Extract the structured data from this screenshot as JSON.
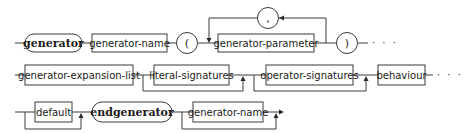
{
  "diagram": {
    "type": "syntax-diagram",
    "rows": [
      {
        "id": "row1",
        "elements": [
          {
            "kind": "terminal",
            "label": "generator"
          },
          {
            "kind": "nonterminal",
            "label": "generator-name"
          },
          {
            "kind": "symbol",
            "label": "("
          },
          {
            "kind": "nonterminal",
            "label": "generator-parameter",
            "repeat_separator": ","
          },
          {
            "kind": "symbol",
            "label": ")"
          },
          {
            "kind": "continuation",
            "label": "· · ·"
          }
        ]
      },
      {
        "id": "row2",
        "elements": [
          {
            "kind": "nonterminal",
            "label": "generator-expansion-list"
          },
          {
            "kind": "nonterminal",
            "label": "literal-signatures",
            "optional": true
          },
          {
            "kind": "nonterminal",
            "label": "operator-signatures",
            "optional": true
          },
          {
            "kind": "nonterminal",
            "label": "behaviour"
          },
          {
            "kind": "continuation",
            "label": "· · ·"
          }
        ]
      },
      {
        "id": "row3",
        "elements": [
          {
            "kind": "nonterminal",
            "label": "default",
            "optional": true
          },
          {
            "kind": "terminal",
            "label": "endgenerator"
          },
          {
            "kind": "nonterminal",
            "label": "generator-name",
            "optional": true
          }
        ]
      }
    ],
    "separator_label": ","
  }
}
